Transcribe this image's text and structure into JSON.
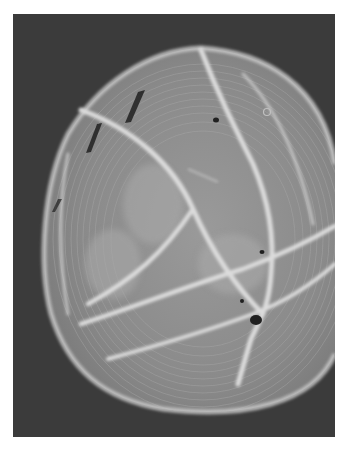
{
  "image": {
    "kind": "grayscale microscopy photograph",
    "subject": "spherical cell-like body with concentric interference rings and bright crossing ridge lines",
    "colors": {
      "page_background": "#ffffff",
      "photo_background": "#3b3b3b",
      "disc_fill": "#8c8c8c",
      "disc_fill_light": "#a6a6a6",
      "ridge": "#dcdcdc",
      "rim": "#c8c8c8",
      "dark_spot": "#1e1e1e"
    }
  }
}
